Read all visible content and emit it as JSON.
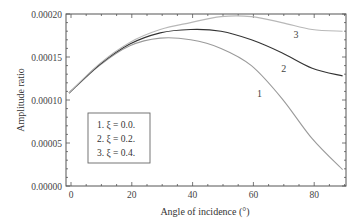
{
  "chart_data": {
    "type": "line",
    "title": "",
    "xlabel": "Angle of incidence (°)",
    "ylabel": "Amplitude ratio",
    "xlim": [
      -1,
      92
    ],
    "ylim": [
      0.0,
      0.0002
    ],
    "xticks": [
      0,
      20,
      40,
      60,
      80
    ],
    "xtick_labels": [
      "0",
      "20",
      "40",
      "60",
      "80"
    ],
    "yticks": [
      0.0,
      5e-05,
      0.0001,
      0.00015,
      0.0002
    ],
    "ytick_labels": [
      "0.00000",
      "0.00005",
      "0.00010",
      "0.00015",
      "0.00020"
    ],
    "grid": false,
    "legend_position": "lower-left inside",
    "legend": [
      "1. ξ = 0.0.",
      "2. ξ = 0.2.",
      "3. ξ = 0.4."
    ],
    "x": [
      0,
      10,
      20,
      30,
      40,
      50,
      60,
      70,
      80,
      90
    ],
    "series": [
      {
        "name": "1. ξ = 0.0.",
        "label": "1",
        "color": "#9a9a9a",
        "values": [
          0.000108,
          0.00014,
          0.000163,
          0.000172,
          0.00017,
          0.00016,
          0.00014,
          0.000102,
          5.5e-05,
          1.9e-05
        ]
      },
      {
        "name": "2. ξ = 0.2.",
        "label": "2",
        "color": "#333333",
        "values": [
          0.000108,
          0.000141,
          0.000165,
          0.000178,
          0.000182,
          0.00018,
          0.00017,
          0.000155,
          0.000137,
          0.000128
        ]
      },
      {
        "name": "3. ξ = 0.4.",
        "label": "3",
        "color": "#b8b8b8",
        "values": [
          0.000108,
          0.000142,
          0.000167,
          0.000182,
          0.00019,
          0.000197,
          0.000197,
          0.00019,
          0.000182,
          0.00018
        ]
      }
    ],
    "annotations": [
      {
        "text": "1",
        "x": 62,
        "y": 0.000103
      },
      {
        "text": "2",
        "x": 70,
        "y": 0.000133
      },
      {
        "text": "3",
        "x": 74,
        "y": 0.000172
      }
    ]
  }
}
